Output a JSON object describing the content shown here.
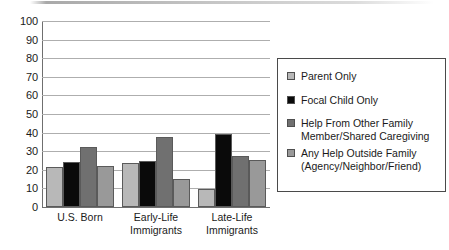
{
  "chart_data": {
    "type": "bar",
    "title": "",
    "subtitle": "",
    "xlabel": "",
    "ylabel": "",
    "ylim": [
      0,
      100
    ],
    "ytick_step": 10,
    "yticks": [
      "100",
      "90",
      "80",
      "70",
      "60",
      "50",
      "40",
      "30",
      "20",
      "10",
      "0"
    ],
    "grid": true,
    "grid_axis": "y",
    "legend_position": "right",
    "categories": [
      "U.S. Born",
      "Early-Life Immigrants",
      "Late-Life Immigrants"
    ],
    "category_lines": [
      [
        "U.S. Born"
      ],
      [
        "Early-Life",
        "Immigrants"
      ],
      [
        "Late-Life",
        "Immigrants"
      ]
    ],
    "series": [
      {
        "name": "Parent Only",
        "legend_lines": [
          "Parent Only"
        ],
        "color": "#b8b8b8",
        "values": [
          21.5,
          23.5,
          9.5
        ]
      },
      {
        "name": "Focal Child Only",
        "legend_lines": [
          "Focal Child Only"
        ],
        "color": "#0a0a0a",
        "values": [
          24,
          25,
          39.5
        ]
      },
      {
        "name": "Help From Other Family Member/Shared Caregiving",
        "legend_lines": [
          "Help From Other Family",
          "Member/Shared Caregiving"
        ],
        "color": "#707070",
        "values": [
          32,
          37.5,
          27.5
        ]
      },
      {
        "name": "Any Help Outside Family (Agency/Neighbor/Friend)",
        "legend_lines": [
          "Any Help Outside Family",
          "(Agency/Neighbor/Friend)"
        ],
        "color": "#999999",
        "values": [
          22,
          15,
          25.5
        ]
      }
    ]
  }
}
